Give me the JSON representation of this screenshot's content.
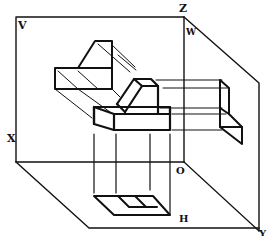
{
  "diagram": {
    "type": "three-plane orthographic projection",
    "labels": {
      "V": "V",
      "Z": "Z",
      "W": "W",
      "X": "X",
      "O": "O",
      "H": "H",
      "Y": "Y"
    },
    "planes": [
      {
        "name": "V",
        "role": "frontal projection plane"
      },
      {
        "name": "W",
        "role": "side projection plane"
      },
      {
        "name": "H",
        "role": "horizontal projection plane"
      }
    ],
    "axes": [
      "X",
      "Y",
      "Z"
    ],
    "origin": "O",
    "colors": {
      "stroke": "#111111",
      "background": "#ffffff"
    }
  }
}
